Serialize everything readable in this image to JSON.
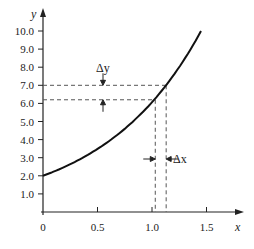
{
  "chart_data": {
    "type": "line",
    "title": "",
    "xlabel": "x",
    "ylabel": "y",
    "xlim": [
      0,
      1.6
    ],
    "ylim": [
      0,
      10.5
    ],
    "x_ticks": [
      "0",
      "0.5",
      "1.0",
      "1.5"
    ],
    "y_ticks": [
      "1.0",
      "2.0",
      "3.0",
      "4.0",
      "5.0",
      "6.0",
      "7.0",
      "8.0",
      "9.0",
      "10.0"
    ],
    "grid": false,
    "legend": null,
    "series": [
      {
        "name": "curve",
        "x": [
          0,
          0.2,
          0.4,
          0.6,
          0.8,
          1.0,
          1.03,
          1.13,
          1.2,
          1.3,
          1.45
        ],
        "values": [
          2.0,
          2.5,
          3.1,
          3.9,
          4.8,
          6.0,
          6.2,
          7.0,
          7.5,
          8.4,
          10.0
        ]
      }
    ],
    "annotations": {
      "delta_y": {
        "label": "Δy",
        "y_low": 6.2,
        "y_high": 7.0
      },
      "delta_x": {
        "label": "Δx",
        "x_low": 1.03,
        "x_high": 1.13
      }
    }
  }
}
